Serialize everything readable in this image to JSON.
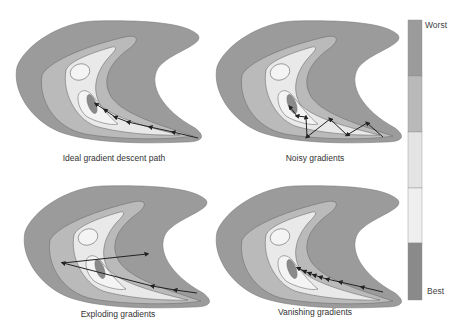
{
  "colorbar": {
    "top_label": "Worst",
    "bottom_label": "Best",
    "segments": [
      "#9b9b9b",
      "#b9b9b9",
      "#e4e4e4",
      "#efefef",
      "#8a8a8a"
    ]
  },
  "contour_colors": {
    "outer": "#9b9b9b",
    "mid": "#bababa",
    "inner": "#e9e9e9",
    "core": "#f4f4f4",
    "minimum": "#8a8a8a",
    "line": "#6f6f6f",
    "path": "#222222"
  },
  "panels": [
    {
      "label": "Ideal gradient descent path"
    },
    {
      "label": "Noisy gradients"
    },
    {
      "label": "Exploding gradients"
    },
    {
      "label": "Vanishing gradients"
    }
  ]
}
